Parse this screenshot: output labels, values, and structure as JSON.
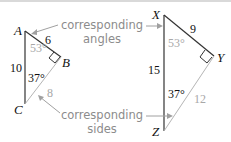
{
  "triangle1": {
    "vertices": {
      "A": "A",
      "B": "B",
      "C": "C"
    },
    "sides": {
      "AB": "6",
      "AC": "10",
      "BC": "8"
    },
    "angles": {
      "A": "53°",
      "C": "37°"
    }
  },
  "triangle2": {
    "vertices": {
      "X": "X",
      "Y": "Y",
      "Z": "Z"
    },
    "sides": {
      "XY": "9",
      "XZ": "15",
      "YZ": "12"
    },
    "angles": {
      "X": "53°",
      "Z": "37°"
    }
  },
  "callouts": {
    "angles_line1": "corresponding",
    "angles_line2": "angles",
    "sides_line1": "corresponding",
    "sides_line2": "sides"
  },
  "colors": {
    "dark": "#222222",
    "grey": "#a8a8a8",
    "caption": "#8c8c8c"
  }
}
